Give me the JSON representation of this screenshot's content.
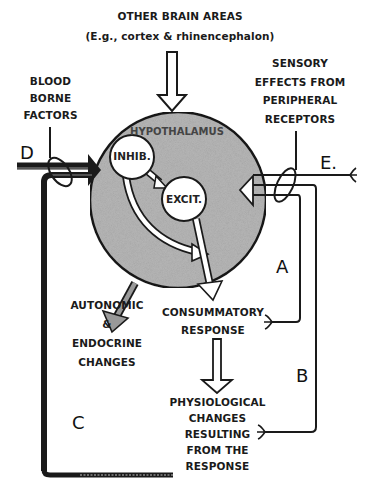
{
  "diagram": {
    "title_top": {
      "line1": "OTHER BRAIN AREAS",
      "line2": "(E.g., cortex & rhinencephalon)"
    },
    "blood_borne": [
      "BLOOD",
      "BORNE",
      "FACTORS"
    ],
    "sensory": [
      "SENSORY",
      "EFFECTS FROM",
      "PERIPHERAL",
      "RECEPTORS"
    ],
    "hypothalamus_label": "HYPOTHALAMUS",
    "inhib_label": "INHIB.",
    "excit_label": "EXCIT.",
    "autonomic": [
      "AUTONOMIC",
      "&",
      "ENDOCRINE",
      "CHANGES"
    ],
    "consummatory": [
      "CONSUMMATORY",
      "RESPONSE"
    ],
    "physiological": [
      "PHYSIOLOGICAL",
      "CHANGES",
      "RESULTING",
      "FROM THE",
      "RESPONSE"
    ],
    "letters": {
      "a": "A",
      "b": "B",
      "c": "C",
      "d": "D",
      "e": "E."
    },
    "colors": {
      "hypothalamus_fill": "#b5b5b5",
      "stroke": "#1a1a1a",
      "background": "#ffffff"
    }
  }
}
